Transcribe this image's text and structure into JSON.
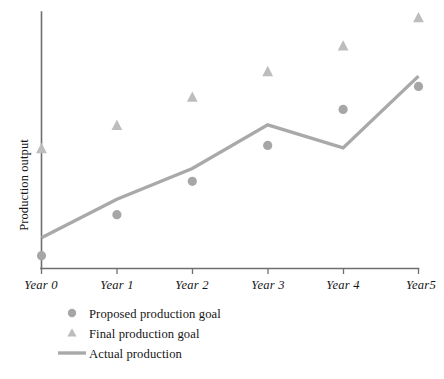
{
  "chart_data": {
    "type": "scatter",
    "title": "",
    "subtitle": "",
    "xlabel": "",
    "ylabel": "Production output",
    "categories": [
      "Year 0",
      "Year 1",
      "Year 2",
      "Year 3",
      "Year 4",
      "Year5"
    ],
    "x": [
      0,
      1,
      2,
      3,
      4,
      5
    ],
    "xlim": [
      0,
      5
    ],
    "ylim": [
      0,
      100
    ],
    "grid": false,
    "legend_position": "bottom-left",
    "y_axis_ticks_shown": false,
    "series": [
      {
        "name": "Proposed production goal",
        "marker": "circle",
        "color": "#a6a6a6",
        "render": "markers",
        "values": [
          5,
          21,
          34,
          48,
          62,
          71
        ]
      },
      {
        "name": "Final production goal",
        "marker": "triangle",
        "color": "#bdbdbd",
        "render": "markers",
        "values": [
          47,
          56,
          67,
          77,
          87,
          98
        ]
      },
      {
        "name": "Actual production",
        "marker": "none",
        "color": "#a9a9a9",
        "render": "line",
        "values": [
          12,
          27,
          39,
          56,
          47,
          75
        ]
      }
    ]
  },
  "axes": {
    "y_label": "Production output",
    "x_tick_labels": [
      "Year 0",
      "Year 1",
      "Year 2",
      "Year 3",
      "Year 4",
      "Year5"
    ]
  },
  "legend": {
    "items": [
      {
        "label": "Proposed production goal",
        "marker": "circle",
        "color": "#a6a6a6"
      },
      {
        "label": "Final production goal",
        "marker": "triangle",
        "color": "#bdbdbd"
      },
      {
        "label": "Actual production",
        "marker": "line",
        "color": "#a9a9a9"
      }
    ]
  },
  "colors": {
    "axis": "#6f6f6f",
    "proposed_marker": "#a6a6a6",
    "final_marker": "#bdbdbd",
    "actual_line": "#a9a9a9",
    "text": "#151515",
    "background": "#ffffff"
  }
}
